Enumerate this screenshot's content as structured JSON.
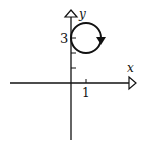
{
  "diagram": {
    "type": "parametric-curve-on-axes",
    "axes": {
      "x_label": "x",
      "y_label": "y",
      "x_tick_label": "1",
      "y_tick_label": "3"
    },
    "curve": {
      "shape": "circle",
      "center": [
        1,
        3
      ],
      "radius": 1,
      "direction": "clockwise"
    },
    "colors": {
      "stroke": "#111111",
      "background": "#ffffff"
    }
  }
}
